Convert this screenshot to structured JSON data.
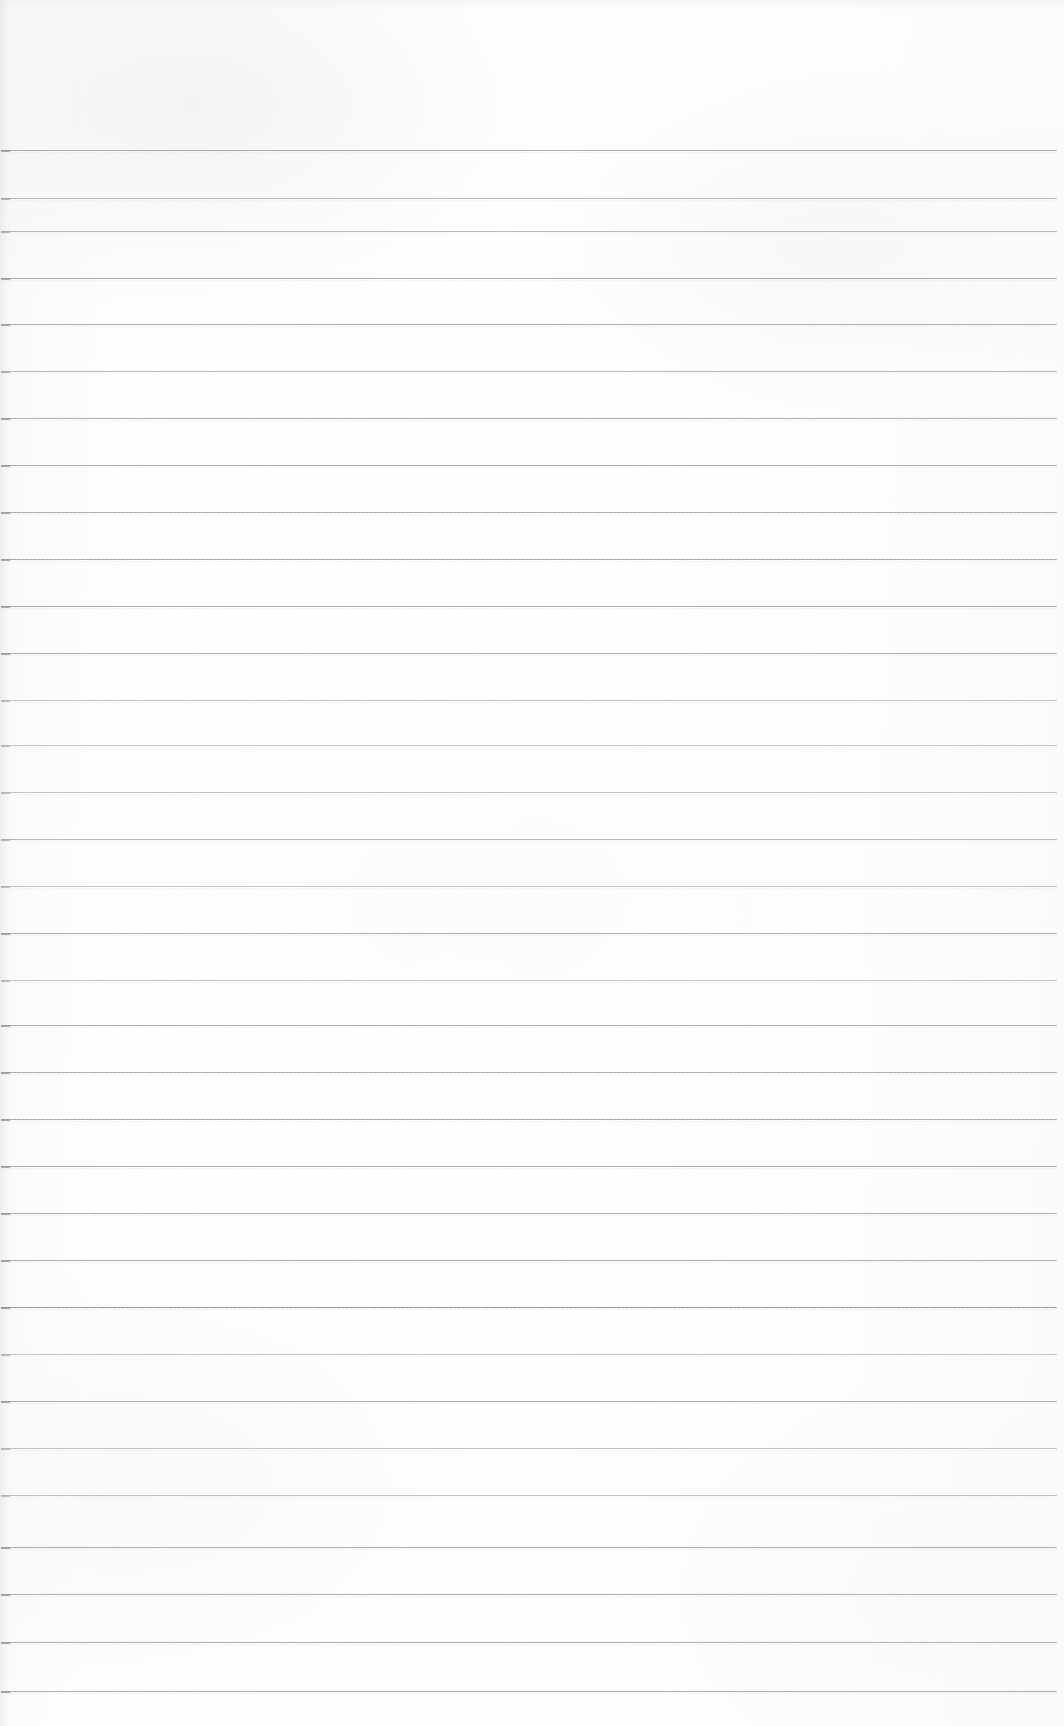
{
  "document": {
    "kind": "scanned-lined-paper",
    "title": "Blank ruled notebook page",
    "orientation": "portrait",
    "page_width_px": 1064,
    "page_height_px": 1726,
    "has_text": false,
    "has_handwriting": false,
    "has_header": false,
    "has_footer": false,
    "has_margin_rule": false,
    "has_page_number": false,
    "content_text": ""
  },
  "paper": {
    "background_color": "#fdfdfd",
    "edge_tint_color": "#f4f4f6",
    "texture": "faint-vertical-scan-banding"
  },
  "ruling": {
    "line_color": "#9b9ba0",
    "ghost_line_color": "#cfcfd4",
    "line_thickness_px": 1,
    "line_count": 33,
    "first_line_y_px": 150,
    "last_line_y_px": 1693,
    "line_spacing_px": 48.2,
    "line_start_x_px": 1,
    "line_end_x_px": 1057,
    "top_margin_px": 150,
    "bottom_margin_px": 33,
    "left_margin_px": 1,
    "right_margin_px": 7,
    "lines": [
      {
        "index": 1,
        "y": 150,
        "weight": "normal"
      },
      {
        "index": 2,
        "y": 198,
        "weight": "light"
      },
      {
        "index": 3,
        "y": 231,
        "weight": "light"
      },
      {
        "index": 4,
        "y": 278,
        "weight": "normal"
      },
      {
        "index": 5,
        "y": 324,
        "weight": "normal"
      },
      {
        "index": 6,
        "y": 371,
        "weight": "light"
      },
      {
        "index": 7,
        "y": 418,
        "weight": "normal"
      },
      {
        "index": 8,
        "y": 465,
        "weight": "normal"
      },
      {
        "index": 9,
        "y": 512,
        "weight": "normal"
      },
      {
        "index": 10,
        "y": 559,
        "weight": "normal"
      },
      {
        "index": 11,
        "y": 606,
        "weight": "normal"
      },
      {
        "index": 12,
        "y": 653,
        "weight": "normal"
      },
      {
        "index": 13,
        "y": 700,
        "weight": "lighter"
      },
      {
        "index": 14,
        "y": 745,
        "weight": "lighter"
      },
      {
        "index": 15,
        "y": 792,
        "weight": "lighter"
      },
      {
        "index": 16,
        "y": 839,
        "weight": "light"
      },
      {
        "index": 17,
        "y": 886,
        "weight": "lighter"
      },
      {
        "index": 18,
        "y": 933,
        "weight": "normal"
      },
      {
        "index": 19,
        "y": 980,
        "weight": "lighter"
      },
      {
        "index": 20,
        "y": 1025,
        "weight": "normal"
      },
      {
        "index": 21,
        "y": 1072,
        "weight": "normal"
      },
      {
        "index": 22,
        "y": 1119,
        "weight": "normal"
      },
      {
        "index": 23,
        "y": 1166,
        "weight": "normal"
      },
      {
        "index": 24,
        "y": 1213,
        "weight": "normal"
      },
      {
        "index": 25,
        "y": 1260,
        "weight": "normal"
      },
      {
        "index": 26,
        "y": 1307,
        "weight": "dark"
      },
      {
        "index": 27,
        "y": 1354,
        "weight": "lighter"
      },
      {
        "index": 28,
        "y": 1401,
        "weight": "normal"
      },
      {
        "index": 29,
        "y": 1448,
        "weight": "lighter"
      },
      {
        "index": 30,
        "y": 1495,
        "weight": "lighter"
      },
      {
        "index": 31,
        "y": 1547,
        "weight": "normal"
      },
      {
        "index": 32,
        "y": 1594,
        "weight": "normal"
      },
      {
        "index": 33,
        "y": 1642,
        "weight": "normal"
      },
      {
        "index": 34,
        "y": 1691,
        "weight": "normal"
      }
    ]
  }
}
